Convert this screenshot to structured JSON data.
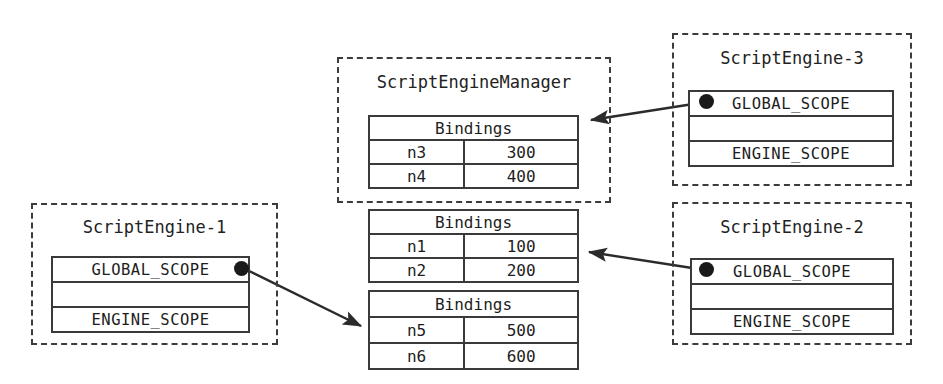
{
  "diagram": {
    "width": 943,
    "height": 384,
    "line_color": "#2b2b2b",
    "box_border_color": "#3c3c3c",
    "dot_color": "#1a1a1a"
  },
  "manager": {
    "label": "ScriptEngineManager",
    "global_bindings": {
      "header": "Bindings",
      "rows": [
        {
          "key": "n3",
          "value": "300"
        },
        {
          "key": "n4",
          "value": "400"
        }
      ]
    }
  },
  "shared_bindings": [
    {
      "header": "Bindings",
      "rows": [
        {
          "key": "n1",
          "value": "100"
        },
        {
          "key": "n2",
          "value": "200"
        }
      ]
    },
    {
      "header": "Bindings",
      "rows": [
        {
          "key": "n5",
          "value": "500"
        },
        {
          "key": "n6",
          "value": "600"
        }
      ]
    }
  ],
  "engines": [
    {
      "id": "engine-1",
      "label": "ScriptEngine-1",
      "scopes": [
        "GLOBAL_SCOPE",
        "",
        "ENGINE_SCOPE"
      ],
      "dot_side": "right"
    },
    {
      "id": "engine-2",
      "label": "ScriptEngine-2",
      "scopes": [
        "GLOBAL_SCOPE",
        "",
        "ENGINE_SCOPE"
      ],
      "dot_side": "left"
    },
    {
      "id": "engine-3",
      "label": "ScriptEngine-3",
      "scopes": [
        "GLOBAL_SCOPE",
        "",
        "ENGINE_SCOPE"
      ],
      "dot_side": "left"
    }
  ],
  "connections": [
    {
      "from": "engine-3-global-scope",
      "to": "manager-bindings-n3-n4"
    },
    {
      "from": "engine-2-global-scope",
      "to": "shared-bindings-n1-n2"
    },
    {
      "from": "engine-1-global-scope",
      "to": "shared-bindings-n5-n6"
    }
  ]
}
